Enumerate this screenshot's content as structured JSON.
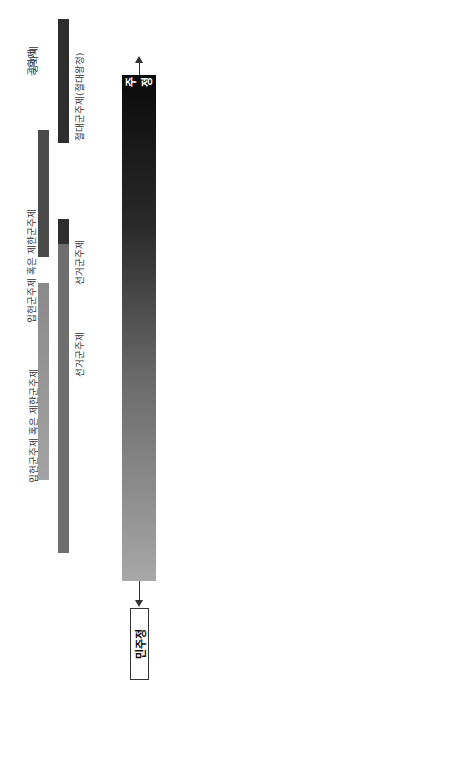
{
  "main_axis": {
    "left_end_label": "민주정",
    "right_end_label": "군주정",
    "gradient_from": "#a8a8a8",
    "gradient_to": "#0a0a0a"
  },
  "type_bars": [
    {
      "label": "공화제",
      "color": "#9a9a9a"
    },
    {
      "label": "선거군주제",
      "color": "#6e6e6e"
    },
    {
      "label": "입헌군주제 혹은 제한군주제",
      "color": "#4a4a4a"
    },
    {
      "label": "절대군주제(절대왕정)",
      "color": "#333333"
    },
    {
      "label": "전제군주제",
      "color": "#1a1a1a"
    }
  ],
  "upper_states": [
    {
      "label": "스위스",
      "sub": "아이슬란드"
    },
    {
      "label": "제치포스폴리타",
      "sub": "공화국(폴란드-리투아니아연방)"
    },
    {
      "label": "잉글랜드",
      "sub": "스코틀랜드"
    },
    {
      "label": "스웨덴",
      "sub": "프로이센"
    },
    {
      "label": "프랑스",
      "sub": ""
    },
    {
      "label": "러시아",
      "sub": ""
    },
    {
      "label": "교황령",
      "sub": ""
    }
  ],
  "lower_states": [
    {
      "label": "한자동맹"
    },
    {
      "label": "베네치아",
      "sub": "제노바"
    },
    {
      "label": "연합주"
    },
    {
      "label": "신성로마제국"
    },
    {
      "label": "연합왕국",
      "sub": "(1707년 이후)"
    },
    {
      "label": "스페인(에스파냐)",
      "sub": "오스트리아"
    },
    {
      "label": "오스만제국"
    }
  ],
  "england": {
    "title": "잉글랜드의 정치체제의 변화, 17세기",
    "stuart_label": "스튜어트왕조",
    "kings": [
      "제임스 1세",
      "찰스 1세",
      "찰스 2세",
      "제임스 2세"
    ],
    "stuart_bar_note": "찰스 1세, 1630~1641",
    "cromwell_label": "크롬웰",
    "parliament_label": "의회주의적",
    "commonwealth_label": "공화정 1649",
    "protectorate_label": "호국경 독재",
    "commons_label": "코먼웰스",
    "settlement_label": "1689년 정착",
    "axis_left_label": "공화국",
    "axis_right_label": "절대주의"
  },
  "democracy_principles": {
    "title": "민주주의 원칙",
    "items": [
      "대의기관과 선출된 관리를 통한 국민의 통치, 통치자와 국민 간 계약에 의한 계승.",
      "통치자를 포함하는 모든 권력을 제한하는 법률(입헌 정부)에 의한 통치.",
      "시민의 권리와 자유가 통치자 혹은 국가의 권리와 자유보다 강조됨",
      "권력의 분산화 경향과 지역 및 지방 기관의 권한 강화"
    ],
    "example_label": "고대의 사례:",
    "example_text": "아테네, 로마 공화정"
  },
  "monarchy_principles": {
    "title": "군주제 원칙",
    "items": [
      "지명된 관리들을 통한 1인군주, 전제군주, 독재자 통치",
      "신권 혹은 자체-지명에 따른 계승: 세습 원칙",
      "통치자의 의지는 최고. '통치자의 명령은 '법'",
      "통치자의 권리가 피지배자의 권리보다 강조됨",
      "권력의 집중화 경향과 지역 및 지방의 권한 위축"
    ],
    "example_label": "고대의 사례:",
    "example_text": "스파르타, 페르시아제국, 로마제국"
  }
}
